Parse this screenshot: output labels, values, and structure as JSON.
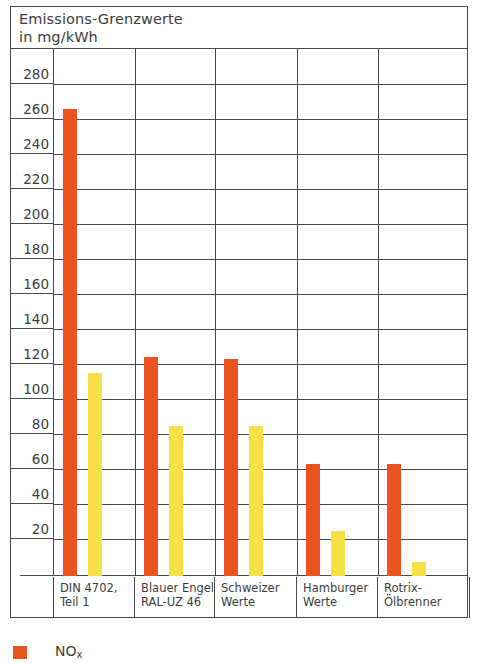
{
  "chart_data": {
    "type": "bar",
    "title": "Emissions-Grenzwerte",
    "subtitle": "in mg/kWh",
    "xlabel": "",
    "ylabel": "",
    "ylim": [
      0,
      290
    ],
    "ytick_step": 20,
    "ytick_labels": [
      "280",
      "260",
      "240",
      "220",
      "200",
      "180",
      "160",
      "140",
      "120",
      "100",
      "80",
      "60",
      "40",
      "20"
    ],
    "grid": true,
    "legend_position": "below-left",
    "categories": [
      "DIN 4702,\nTeil 1",
      "Blauer Engel\nRAL-UZ 46",
      "Schweizer\nWerte",
      "Hamburger\nWerte",
      "Rotrix-\nÖlbrenner"
    ],
    "series": [
      {
        "name": "NOx",
        "color": "#e8531e",
        "values": [
          267,
          125,
          124,
          64,
          64
        ]
      },
      {
        "name": "CO",
        "color": "#f7e045",
        "values": [
          116,
          86,
          86,
          26,
          8
        ]
      }
    ]
  },
  "title": {
    "line1": "Emissions-Grenzwerte",
    "line2": "in mg/kWh"
  },
  "yaxis": {
    "ticks": [
      {
        "label": "280"
      },
      {
        "label": "260"
      },
      {
        "label": "240"
      },
      {
        "label": "220"
      },
      {
        "label": "200"
      },
      {
        "label": "180"
      },
      {
        "label": "160"
      },
      {
        "label": "140"
      },
      {
        "label": "120"
      },
      {
        "label": "100"
      },
      {
        "label": "80"
      },
      {
        "label": "60"
      },
      {
        "label": "40"
      },
      {
        "label": "20"
      }
    ]
  },
  "categories": [
    {
      "line1": "DIN 4702,",
      "line2": "Teil 1"
    },
    {
      "line1": "Blauer Engel",
      "line2": "RAL-UZ 46"
    },
    {
      "line1": "Schweizer",
      "line2": "Werte"
    },
    {
      "line1": "Hamburger",
      "line2": "Werte"
    },
    {
      "line1": "Rotrix-",
      "line2": "Ölbrenner"
    }
  ],
  "legend": {
    "entries": [
      {
        "name": "NOx",
        "label_main": "NO",
        "label_sub": "x",
        "color": "#e8531e"
      }
    ]
  },
  "colors": {
    "nox": "#e8531e",
    "co": "#f7e045",
    "ink": "#3c3c3c",
    "rule": "#4a4a4a",
    "background": "#ffffff"
  }
}
